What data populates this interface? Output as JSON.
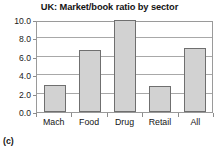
{
  "caption": "(c)",
  "chart_data": {
    "type": "bar",
    "title": "UK: Market/book ratio by sector",
    "xlabel": "",
    "ylabel": "",
    "categories": [
      "Mach",
      "Food",
      "Drug",
      "Retail",
      "All"
    ],
    "values": [
      2.9,
      6.7,
      10.0,
      2.8,
      7.0
    ],
    "ylim": [
      0.0,
      10.0
    ],
    "yticks": [
      0.0,
      2.0,
      4.0,
      6.0,
      8.0,
      10.0
    ],
    "ytick_labels": [
      "0.0",
      "2.0",
      "4.0",
      "6.0",
      "8.0",
      "10.0"
    ],
    "grid": true,
    "legend": false,
    "bar_fill_color": "#d2d2d2",
    "bar_border_color": "#6f6f6f",
    "gridline_color": "#a8a8a8",
    "frame_color": "#9a9a9a",
    "background_color": "#ffffff"
  }
}
